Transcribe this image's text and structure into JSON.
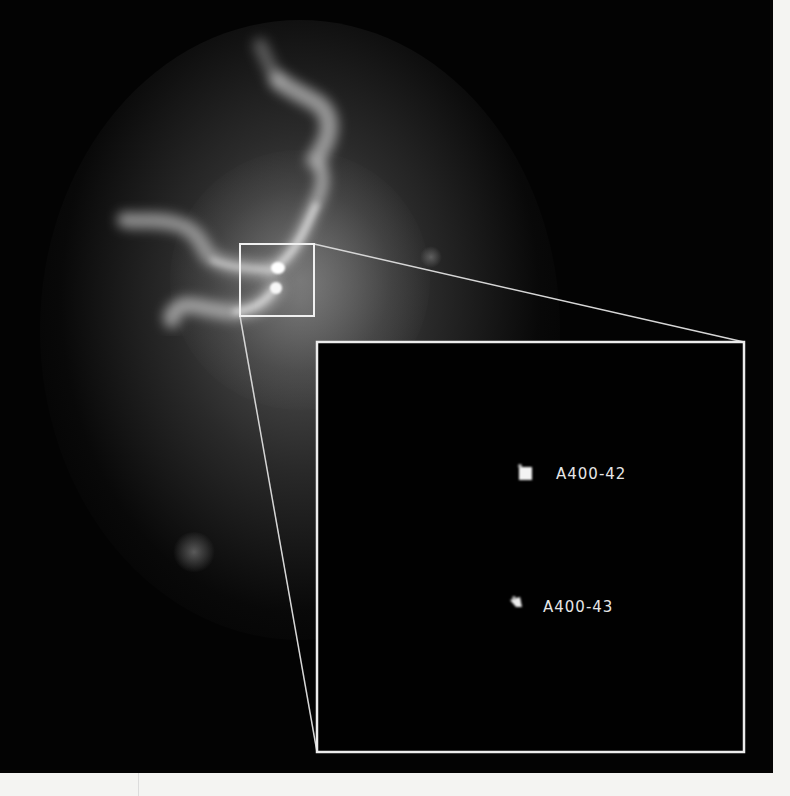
{
  "image": {
    "subject": "radio jets with zoom inset",
    "background_color": "#030303",
    "frame_color": "#e8e8e8"
  },
  "zoom_box": {
    "x": 240,
    "y": 244,
    "width": 74,
    "height": 72
  },
  "inset": {
    "x": 317,
    "y": 342,
    "width": 427,
    "height": 410,
    "sources": [
      {
        "id": "source-1",
        "label": "A400-42",
        "x": 526,
        "y": 474
      },
      {
        "id": "source-2",
        "label": "A400-43",
        "x": 516,
        "y": 606
      }
    ]
  }
}
